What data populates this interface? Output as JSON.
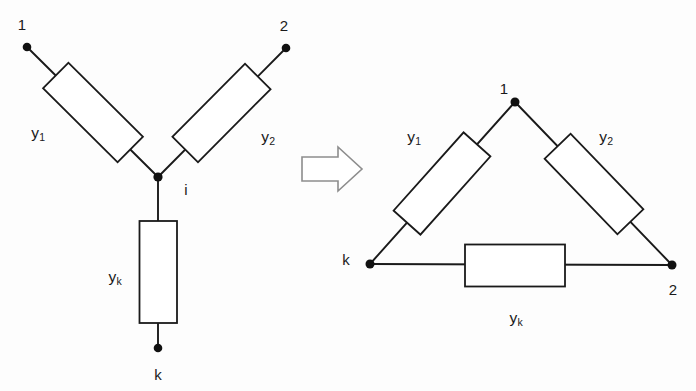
{
  "figure": {
    "type": "circuit-transformation-diagram",
    "background_color": "#fdfdfd",
    "line_color": "#1a1a1a",
    "arrow_color": "#8d8d8d"
  },
  "connector": {
    "name": "transformation-arrow",
    "direction": "right",
    "label": ""
  },
  "star_network": {
    "title": "",
    "nodes": [
      {
        "id": "n1",
        "label": "1",
        "x": 27,
        "y": 47,
        "label_x": 22,
        "label_y": 24
      },
      {
        "id": "n2",
        "label": "2",
        "x": 286,
        "y": 48,
        "label_x": 284,
        "label_y": 25
      },
      {
        "id": "ni",
        "label": "i",
        "x": 158,
        "y": 177,
        "label_x": 186,
        "label_y": 189
      },
      {
        "id": "nk",
        "label": "k",
        "x": 158,
        "y": 348,
        "label_x": 158,
        "label_y": 374
      }
    ],
    "elements": [
      {
        "id": "y1",
        "label": "y",
        "subscript": "1",
        "label_x": 38,
        "label_y": 133,
        "orientation": "diagonal-down-right"
      },
      {
        "id": "y2",
        "label": "y",
        "subscript": "2",
        "label_x": 268,
        "label_y": 137,
        "orientation": "diagonal-down-left"
      },
      {
        "id": "yk",
        "label": "y",
        "subscript": "k",
        "label_x": 115,
        "label_y": 277,
        "orientation": "vertical"
      }
    ]
  },
  "delta_network": {
    "title": "",
    "nodes": [
      {
        "id": "d1",
        "label": "1",
        "x": 515,
        "y": 102,
        "label_x": 504,
        "label_y": 88
      },
      {
        "id": "dk",
        "label": "k",
        "x": 370,
        "y": 264,
        "label_x": 346,
        "label_y": 259
      },
      {
        "id": "d2",
        "label": "2",
        "x": 672,
        "y": 265,
        "label_x": 673,
        "label_y": 289
      }
    ],
    "elements": [
      {
        "id": "y1",
        "label": "y",
        "subscript": "1",
        "label_x": 414,
        "label_y": 137,
        "orientation": "diagonal-down-left"
      },
      {
        "id": "y2",
        "label": "y",
        "subscript": "2",
        "label_x": 606,
        "label_y": 137,
        "orientation": "diagonal-down-right"
      },
      {
        "id": "yk",
        "label": "y",
        "subscript": "k",
        "label_x": 516,
        "label_y": 318,
        "orientation": "horizontal"
      }
    ]
  }
}
